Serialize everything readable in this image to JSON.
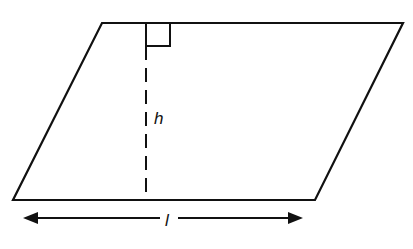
{
  "diagram": {
    "shape": "parallelogram",
    "labels": {
      "height": "h",
      "length": "l"
    },
    "annotations": {
      "right_angle_marker": true,
      "height_line_style": "dashed",
      "length_arrow": "double-headed"
    },
    "colors": {
      "stroke": "#111111",
      "background": "#ffffff"
    }
  }
}
